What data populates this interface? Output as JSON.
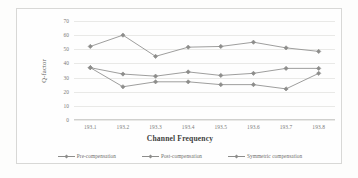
{
  "chart_data": {
    "type": "line",
    "title": "",
    "xlabel": "Channel Frequency",
    "ylabel": "Q-factor",
    "categories": [
      "193.1",
      "193.2",
      "193.3",
      "193.4",
      "193.5",
      "193.6",
      "193.7",
      "193.8"
    ],
    "x": [
      193.1,
      193.2,
      193.3,
      193.4,
      193.5,
      193.6,
      193.7,
      193.8
    ],
    "ylim": [
      0,
      70
    ],
    "yticks": [
      "0",
      "10",
      "20",
      "30",
      "40",
      "50",
      "60",
      "70"
    ],
    "ytick_values": [
      0,
      10,
      20,
      30,
      40,
      50,
      60,
      70
    ],
    "grid": true,
    "legend_position": "bottom",
    "series": [
      {
        "name": "Pre-compensation",
        "color": "#8d8d8b",
        "values": [
          52,
          60,
          45,
          51.5,
          52,
          55,
          51,
          48.5
        ]
      },
      {
        "name": "Post-compensation",
        "color": "#8d8d8b",
        "values": [
          37,
          32.5,
          31,
          34,
          31.5,
          33,
          36.5,
          36.5
        ]
      },
      {
        "name": "Symmetric compensation",
        "color": "#8d8d8b",
        "values": [
          37,
          23.5,
          27,
          27,
          25,
          25,
          22,
          33
        ]
      }
    ]
  },
  "figure": {
    "border_color": "#d8d8d6",
    "grid_color": "#e9e9e7",
    "background": "#fefefe"
  }
}
